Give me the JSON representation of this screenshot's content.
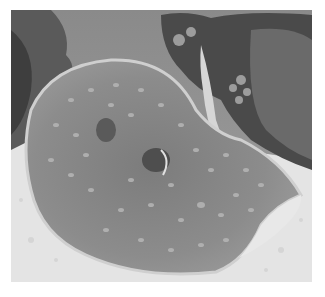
{
  "image": {
    "subject": "stingray",
    "description": "Grayscale photograph of a spotted stingray resting on a sandy seabed with coral behind it",
    "palette": {
      "background": "#ffffff",
      "water": "#8f8f8f",
      "coral_dark": "#3a3a3a",
      "coral_mid": "#6e6e6e",
      "sand": "#e6e6e6",
      "ray_body": "#8a8a8a",
      "ray_edge": "#d8d8d8",
      "spots": "#b4b4b4"
    }
  }
}
